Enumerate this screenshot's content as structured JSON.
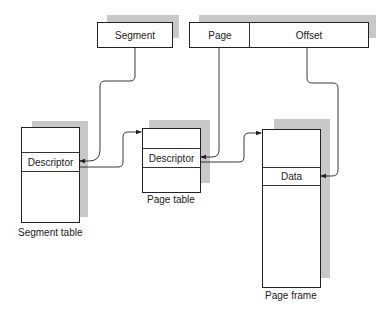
{
  "address": {
    "segment_label": "Segment",
    "page_label": "Page",
    "offset_label": "Offset"
  },
  "segment_table": {
    "entry_label": "Descriptor",
    "caption": "Segment table"
  },
  "page_table": {
    "entry_label": "Descriptor",
    "caption": "Page table"
  },
  "page_frame": {
    "entry_label": "Data",
    "caption": "Page frame"
  },
  "colors": {
    "line": "#222222",
    "shadow": "#c8c8c8",
    "background": "#ffffff"
  }
}
